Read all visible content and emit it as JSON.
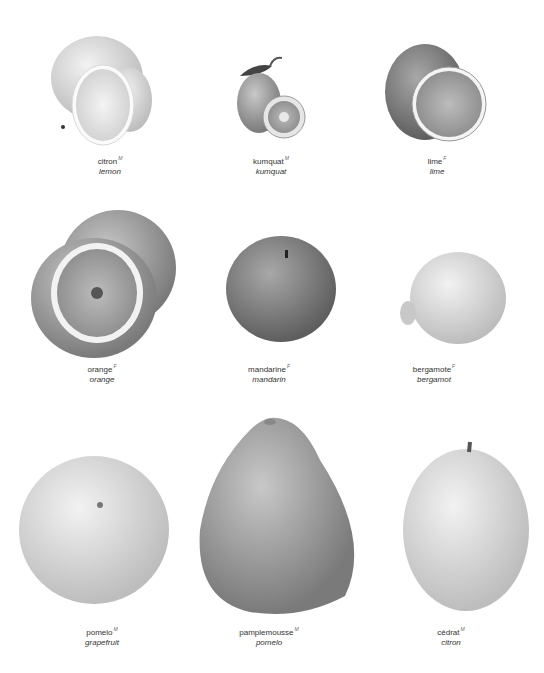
{
  "page": {
    "background": "#ffffff"
  },
  "fruits": [
    {
      "french": "citron",
      "gender": "M",
      "english": "lemon",
      "tone": "#dcdcdc"
    },
    {
      "french": "kumquat",
      "gender": "M",
      "english": "kumquat",
      "tone": "#a8a8a8"
    },
    {
      "french": "lime",
      "gender": "F",
      "english": "lime",
      "tone": "#8f8f8f"
    },
    {
      "french": "orange",
      "gender": "F",
      "english": "orange",
      "tone": "#a0a0a0"
    },
    {
      "french": "mandarine",
      "gender": "F",
      "english": "mandarin",
      "tone": "#8a8a8a"
    },
    {
      "french": "bergamote",
      "gender": "F",
      "english": "bergamot",
      "tone": "#dadada"
    },
    {
      "french": "pomelo",
      "gender": "M",
      "english": "grapefruit",
      "tone": "#d4d4d4"
    },
    {
      "french": "pamplemousse",
      "gender": "M",
      "english": "pomelo",
      "tone": "#b4b4b4"
    },
    {
      "french": "cédrat",
      "gender": "M",
      "english": "citron",
      "tone": "#c8c8c8"
    }
  ]
}
